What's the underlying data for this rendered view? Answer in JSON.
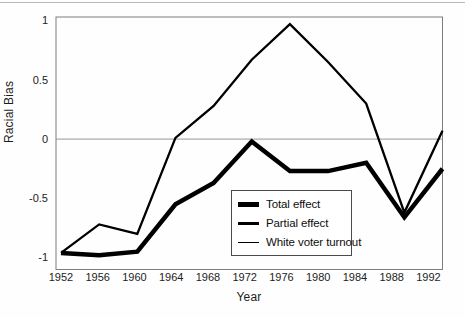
{
  "figure": {
    "background_color": "#fefefe",
    "line_color": "#000000",
    "frame_color": "#7d7d7d",
    "zero_line_color": "#989898",
    "text_color": "#1c1c1c"
  },
  "chart_data": {
    "type": "line",
    "title": "",
    "xlabel": "Year",
    "ylabel": "Racial Bias",
    "x": [
      1952,
      1956,
      1960,
      1964,
      1968,
      1972,
      1976,
      1980,
      1984,
      1988,
      1992
    ],
    "x_tick_labels": [
      "1952",
      "1956",
      "1960",
      "1964",
      "1968",
      "1972",
      "1976",
      "1980",
      "1984",
      "1988",
      "1992"
    ],
    "y_ticks": [
      1,
      0.5,
      0,
      -0.5,
      -1
    ],
    "y_tick_labels": [
      "1",
      "0.5",
      "0",
      "-0.5",
      "-1"
    ],
    "ylim": [
      -1.1,
      1.03
    ],
    "grid": "single horizontal reference line at y=0",
    "legend_position": "inside plot, lower right",
    "series": [
      {
        "name": "Total effect",
        "style": "thick solid black",
        "values": [
          -0.96,
          -0.98,
          -0.95,
          -0.55,
          -0.37,
          -0.02,
          -0.27,
          -0.27,
          -0.2,
          -0.66,
          -0.25
        ]
      },
      {
        "name": "Partial effect",
        "style": "medium solid black",
        "values": [
          -0.96,
          -0.72,
          -0.8,
          0.01,
          0.28,
          0.67,
          0.97,
          0.65,
          0.3,
          -0.62,
          0.07
        ]
      },
      {
        "name": "White voter turnout",
        "style": "thin solid black, visually coincident with Partial effect line in this scan",
        "values": [
          -0.96,
          -0.72,
          -0.8,
          0.01,
          0.28,
          0.67,
          0.97,
          0.65,
          0.3,
          -0.62,
          0.07
        ]
      }
    ]
  }
}
